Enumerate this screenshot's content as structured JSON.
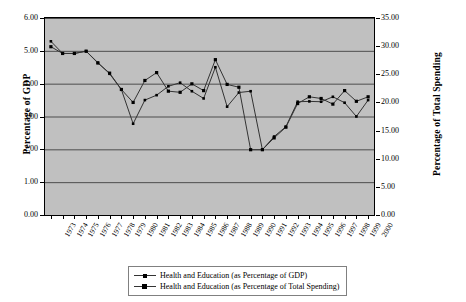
{
  "chart_data": {
    "type": "line",
    "title": "",
    "xlabel": "",
    "ylabel": "Percentage of GDP",
    "ylabel_right": "Percentage of Total Spending",
    "grid": true,
    "legend_position": "bottom",
    "x": [
      1973,
      1974,
      1975,
      1976,
      1977,
      1978,
      1979,
      1980,
      1981,
      1982,
      1983,
      1984,
      1985,
      1986,
      1987,
      1988,
      1989,
      1990,
      1991,
      1992,
      1993,
      1994,
      1995,
      1996,
      1997,
      1998,
      1999,
      2000
    ],
    "xticklabels": [
      "1973",
      "1974",
      "1975",
      "1976",
      "1977",
      "1978",
      "1979",
      "1980",
      "1981",
      "1982",
      "1983",
      "1984",
      "1985",
      "1986",
      "1987",
      "1988",
      "1989",
      "1990",
      "1991",
      "1992",
      "1993",
      "1994",
      "1995",
      "1996",
      "1997",
      "1998",
      "1999",
      "2000"
    ],
    "yticklabels_left": [
      "0.00",
      "1.00",
      "2.00",
      "3.00",
      "4.00",
      "5.00",
      "6.00"
    ],
    "yticks_left": [
      0,
      1,
      2,
      3,
      4,
      5,
      6
    ],
    "ylim": [
      0,
      6
    ],
    "yticklabels_right": [
      "0.00",
      "5.00",
      "10.00",
      "15.00",
      "20.00",
      "25.00",
      "30.00",
      "35.00"
    ],
    "yticks_right": [
      0,
      5,
      10,
      15,
      20,
      25,
      30,
      35
    ],
    "ylim_right": [
      0,
      35
    ],
    "series": [
      {
        "name": "Health and Education (as Percentage of GDP)",
        "axis": "left",
        "values": [
          5.29,
          4.92,
          4.92,
          4.99,
          4.64,
          4.3,
          3.82,
          2.78,
          3.5,
          3.65,
          3.92,
          4.03,
          3.77,
          3.55,
          4.5,
          3.3,
          3.73,
          3.77,
          1.99,
          2.39,
          2.69,
          3.45,
          3.46,
          3.45,
          3.6,
          3.42,
          3.0,
          3.5
        ]
      },
      {
        "name": "Health and Education (as Percentage of  Total Spending)",
        "axis": "right",
        "values": [
          29.9,
          28.7,
          28.7,
          29.1,
          27.0,
          25.2,
          22.3,
          20.0,
          23.9,
          25.3,
          22.0,
          21.8,
          23.3,
          22.1,
          27.6,
          23.2,
          22.7,
          11.6,
          11.6,
          13.7,
          15.6,
          19.8,
          21.0,
          20.7,
          19.7,
          22.1,
          20.2,
          21.0
        ]
      }
    ],
    "colors": {
      "plot_background": "#c0c0c0",
      "gridline": "#4d4d4d",
      "line": "#333333",
      "marker": "#000000",
      "axis": "#000000"
    }
  },
  "legend": {
    "entries": [
      {
        "label": "Health and Education (as Percentage of GDP)"
      },
      {
        "label": "Health and Education (as Percentage of  Total Spending)"
      }
    ]
  }
}
